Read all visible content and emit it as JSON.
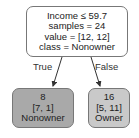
{
  "tree": {
    "root": {
      "lines": [
        "Income ≤ 59.7",
        "samples = 24",
        "value = [12, 12]",
        "class = Nonowner"
      ],
      "fill": "#ffffff"
    },
    "edges": {
      "true_label": "True",
      "false_label": "False"
    },
    "leaf_true": {
      "lines": [
        "8",
        "[7, 1]",
        "Nonowner"
      ],
      "fill": "#a9a9a9"
    },
    "leaf_false": {
      "lines": [
        "16",
        "[5, 11]",
        "Owner"
      ],
      "fill": "#c9c9c9"
    }
  }
}
